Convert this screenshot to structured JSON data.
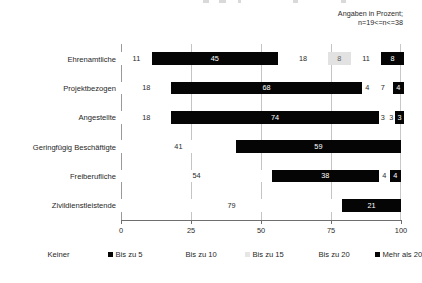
{
  "annotation": {
    "line1": "Angaben in Prozent;",
    "line2": "n=19<=n<=38"
  },
  "axis": {
    "ticks": [
      "0",
      "25",
      "50",
      "75",
      "100"
    ]
  },
  "legend": {
    "items": [
      {
        "label": "Keiner",
        "swatch": "none"
      },
      {
        "label": "Bis zu 5",
        "swatch": "dark"
      },
      {
        "label": "Bis zu 10",
        "swatch": "light"
      },
      {
        "label": "Bis zu 15",
        "swatch": "gray"
      },
      {
        "label": "Bis zu 20",
        "swatch": "light"
      },
      {
        "label": "Mehr als 20",
        "swatch": "dark"
      }
    ]
  },
  "chart_data": {
    "type": "bar",
    "orientation": "horizontal",
    "stacked": true,
    "title": "",
    "subtitle": "Angaben in Prozent; n=19<=n<=38",
    "xlabel": "",
    "ylabel": "",
    "xlim": [
      0,
      100
    ],
    "xticks": [
      0,
      25,
      50,
      75,
      100
    ],
    "grid": true,
    "legend_position": "bottom",
    "categories": [
      "Ehrenamtliche",
      "Projektbezogen",
      "Angestellte",
      "Geringfügig Beschäftigte",
      "Freiberufliche",
      "Zivildienstleistende"
    ],
    "series": [
      {
        "name": "Keiner",
        "color": "#ffffff",
        "style": "light",
        "values": [
          11,
          18,
          18,
          41,
          54,
          79
        ]
      },
      {
        "name": "Bis zu 5",
        "color": "#050505",
        "style": "dark",
        "values": [
          45,
          68,
          74,
          59,
          38,
          21
        ]
      },
      {
        "name": "Bis zu 10",
        "color": "#ffffff",
        "style": "light",
        "values": [
          18,
          4,
          3,
          0,
          4,
          0
        ]
      },
      {
        "name": "Bis zu 15",
        "color": "#e2e2e2",
        "style": "gray",
        "values": [
          8,
          0,
          0,
          0,
          0,
          0
        ]
      },
      {
        "name": "Bis zu 20",
        "color": "#ffffff",
        "style": "light",
        "values": [
          11,
          7,
          3,
          0,
          0,
          0
        ]
      },
      {
        "name": "Mehr als 20",
        "color": "#050505",
        "style": "dark",
        "values": [
          8,
          4,
          3,
          0,
          4,
          0
        ]
      }
    ]
  }
}
